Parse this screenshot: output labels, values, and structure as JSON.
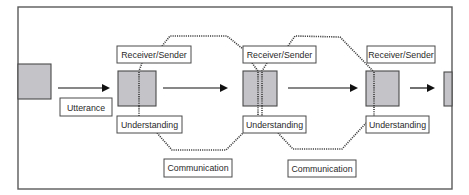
{
  "diagram": {
    "utterance_label": "Utterance",
    "stages": [
      {
        "top_label": "Receiver/Sender",
        "bottom_label": "Understanding"
      },
      {
        "top_label": "Receiver/Sender",
        "bottom_label": "Understanding"
      },
      {
        "top_label": "Receiver/Sender",
        "bottom_label": "Understanding"
      }
    ],
    "communication_labels": [
      "Communication",
      "Communication"
    ]
  },
  "colors": {
    "node_fill": "#c4c4c8",
    "line": "#111111",
    "border": "#4a4a4a"
  }
}
